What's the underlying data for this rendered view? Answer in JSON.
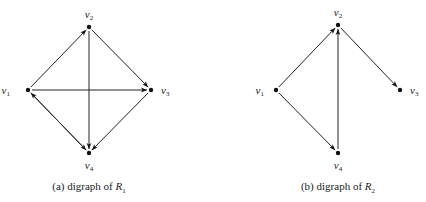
{
  "figures": [
    {
      "id": "a",
      "caption_prefix": "(a) digraph of ",
      "caption_rel": "R",
      "caption_sub": "1",
      "vertices": [
        {
          "id": "v1",
          "name": "v",
          "sub": "1"
        },
        {
          "id": "v2",
          "name": "v",
          "sub": "2"
        },
        {
          "id": "v3",
          "name": "v",
          "sub": "3"
        },
        {
          "id": "v4",
          "name": "v",
          "sub": "4"
        }
      ],
      "edges": [
        {
          "from": "v1",
          "to": "v2"
        },
        {
          "from": "v2",
          "to": "v3"
        },
        {
          "from": "v1",
          "to": "v3"
        },
        {
          "from": "v2",
          "to": "v4"
        },
        {
          "from": "v3",
          "to": "v4"
        },
        {
          "from": "v1",
          "to": "v4"
        },
        {
          "from": "v4",
          "to": "v1"
        }
      ]
    },
    {
      "id": "b",
      "caption_prefix": "(b) digraph of ",
      "caption_rel": "R",
      "caption_sub": "2",
      "vertices": [
        {
          "id": "v1",
          "name": "v",
          "sub": "1"
        },
        {
          "id": "v2",
          "name": "v",
          "sub": "2"
        },
        {
          "id": "v3",
          "name": "v",
          "sub": "3"
        },
        {
          "id": "v4",
          "name": "v",
          "sub": "4"
        }
      ],
      "edges": [
        {
          "from": "v1",
          "to": "v2"
        },
        {
          "from": "v2",
          "to": "v3"
        },
        {
          "from": "v1",
          "to": "v4"
        },
        {
          "from": "v4",
          "to": "v2"
        }
      ]
    }
  ]
}
